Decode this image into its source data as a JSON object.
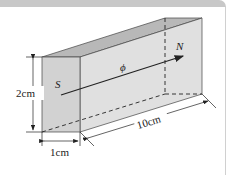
{
  "figure": {
    "labels": {
      "south": "S",
      "north": "N",
      "flux": "ϕ",
      "height": "2cm",
      "width": "1cm",
      "length": "10cm"
    },
    "colors": {
      "front_face": "#d4d4d4",
      "side_face": "#e2e2e2",
      "top_face": "#b4b4b4",
      "line": "#222222",
      "header_band": "#c8c8c8"
    }
  }
}
